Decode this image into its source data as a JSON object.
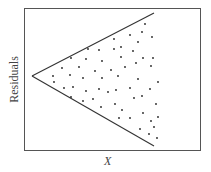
{
  "chart_data": {
    "type": "scatter",
    "title": "",
    "xlabel": "X",
    "ylabel": "Residuals",
    "grid": false,
    "legend": null,
    "annotations": [
      "Funnel-shaped envelope lines showing increasing residual spread with X (heteroscedasticity)"
    ],
    "frame": {
      "left": 24,
      "top": 8,
      "right": 200,
      "bottom": 150
    },
    "envelope": {
      "apex": [
        32,
        76
      ],
      "upper_end": [
        154,
        13
      ],
      "lower_end": [
        154,
        146
      ]
    },
    "points_px": [
      [
        145,
        24
      ],
      [
        142,
        32
      ],
      [
        130,
        35
      ],
      [
        152,
        37
      ],
      [
        114,
        39
      ],
      [
        138,
        42
      ],
      [
        88,
        49
      ],
      [
        99,
        50
      ],
      [
        114,
        49
      ],
      [
        121,
        47
      ],
      [
        133,
        51
      ],
      [
        71,
        58
      ],
      [
        86,
        59
      ],
      [
        121,
        57
      ],
      [
        143,
        58
      ],
      [
        153,
        58
      ],
      [
        102,
        61
      ],
      [
        136,
        63
      ],
      [
        62,
        68
      ],
      [
        79,
        67
      ],
      [
        111,
        70
      ],
      [
        125,
        67
      ],
      [
        151,
        66
      ],
      [
        95,
        71
      ],
      [
        53,
        76
      ],
      [
        70,
        75
      ],
      [
        83,
        78
      ],
      [
        102,
        78
      ],
      [
        118,
        76
      ],
      [
        54,
        82
      ],
      [
        138,
        79
      ],
      [
        158,
        82
      ],
      [
        64,
        88
      ],
      [
        73,
        87
      ],
      [
        86,
        91
      ],
      [
        99,
        89
      ],
      [
        108,
        92
      ],
      [
        116,
        90
      ],
      [
        130,
        88
      ],
      [
        150,
        89
      ],
      [
        71,
        97
      ],
      [
        83,
        101
      ],
      [
        93,
        99
      ],
      [
        134,
        98
      ],
      [
        142,
        96
      ],
      [
        115,
        104
      ],
      [
        101,
        107
      ],
      [
        156,
        104
      ],
      [
        122,
        110
      ],
      [
        143,
        113
      ],
      [
        119,
        118
      ],
      [
        130,
        118
      ],
      [
        158,
        117
      ],
      [
        151,
        121
      ],
      [
        140,
        129
      ],
      [
        149,
        134
      ],
      [
        157,
        138
      ],
      [
        154,
        127
      ]
    ],
    "colors": {
      "line": "#333333",
      "point": "#222222",
      "frame": "#555555"
    }
  }
}
